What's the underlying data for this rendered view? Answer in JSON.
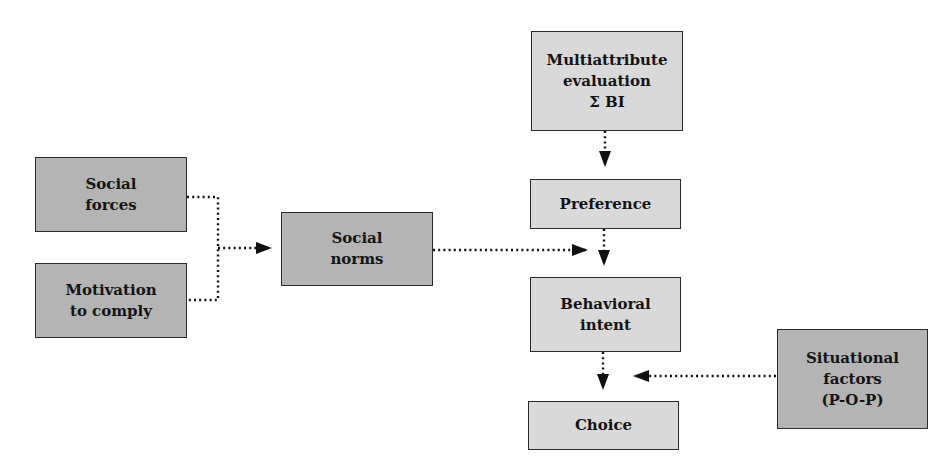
{
  "diagram": {
    "nodes": {
      "social_forces": {
        "line1": "Social",
        "line2": "forces"
      },
      "motivation": {
        "line1": "Motivation",
        "line2": "to comply"
      },
      "social_norms": {
        "line1": "Social",
        "line2": "norms"
      },
      "multiattribute": {
        "line1": "Multiattribute",
        "line2": "evaluation",
        "line3": "Σ BI"
      },
      "preference": {
        "line1": "Preference"
      },
      "behavioral_intent": {
        "line1": "Behavioral",
        "line2": "intent"
      },
      "choice": {
        "line1": "Choice"
      },
      "situational": {
        "line1": "Situational",
        "line2": "factors",
        "line3": "(P-O-P)"
      }
    },
    "edges": [
      {
        "from": "social_forces",
        "to": "social_norms",
        "style": "dotted"
      },
      {
        "from": "motivation",
        "to": "social_norms",
        "style": "dotted"
      },
      {
        "from": "multiattribute",
        "to": "preference",
        "style": "dotted"
      },
      {
        "from": "preference",
        "to": "behavioral_intent",
        "style": "dotted"
      },
      {
        "from": "social_norms",
        "to": "behavioral_intent",
        "style": "dotted"
      },
      {
        "from": "behavioral_intent",
        "to": "choice",
        "style": "dotted"
      },
      {
        "from": "situational",
        "to": "choice",
        "style": "dotted"
      }
    ],
    "colors": {
      "dark_fill": "#b4b4b4",
      "light_fill": "#d9d9d9",
      "border": "#2a2a2a"
    }
  }
}
